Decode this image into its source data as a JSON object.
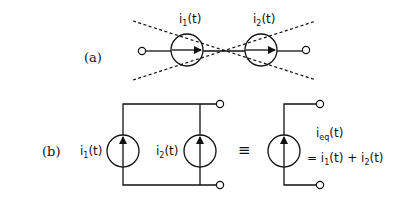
{
  "diagram": {
    "part_a": {
      "label": "(a)",
      "source1": {
        "name": "i",
        "sub": "1",
        "arg": "(t)"
      },
      "source2": {
        "name": "i",
        "sub": "2",
        "arg": "(t)"
      }
    },
    "part_b": {
      "label": "(b)",
      "source1": {
        "name": "i",
        "sub": "1",
        "arg": "(t)"
      },
      "source2": {
        "name": "i",
        "sub": "2",
        "arg": "(t)"
      },
      "equiv_symbol": "≡",
      "equivalent": {
        "name": "i",
        "sub": "eq",
        "arg": "(t)",
        "expr_prefix": "= i",
        "expr_sub1": "1",
        "expr_mid": "(t) + i",
        "expr_sub2": "2",
        "expr_suffix": "(t)"
      }
    }
  }
}
